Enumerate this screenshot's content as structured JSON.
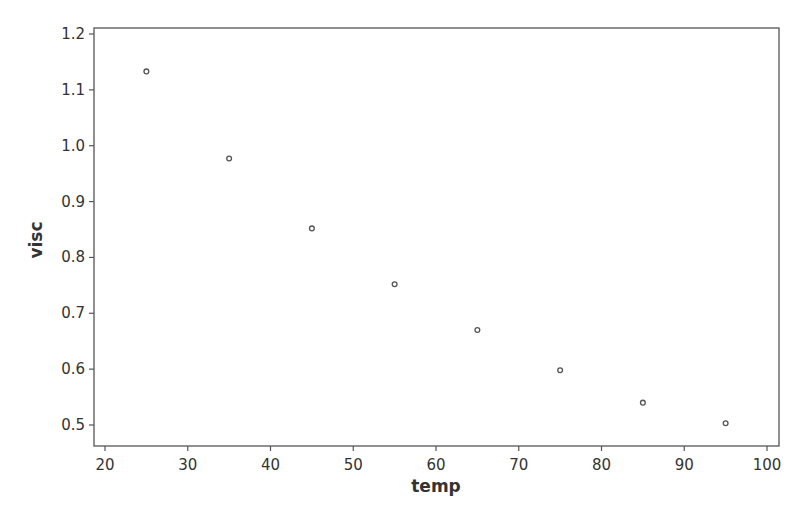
{
  "chart_data": {
    "type": "scatter",
    "title": "",
    "xlabel": "temp",
    "ylabel": "visc",
    "xlim": [
      18.6,
      101.5
    ],
    "ylim": [
      0.463,
      1.211
    ],
    "x_ticks": [
      20,
      30,
      40,
      50,
      60,
      70,
      80,
      90,
      100
    ],
    "y_ticks": [
      0.5,
      0.6,
      0.7,
      0.8,
      0.9,
      1.0,
      1.1,
      1.2
    ],
    "x_tick_labels": [
      "20",
      "30",
      "40",
      "50",
      "60",
      "70",
      "80",
      "90",
      "100"
    ],
    "y_tick_labels": [
      "0.5",
      "0.6",
      "0.7",
      "0.8",
      "0.9",
      "1.0",
      "1.1",
      "1.2"
    ],
    "grid": false,
    "legend": null,
    "series": [
      {
        "name": "visc",
        "x": [
          25,
          35,
          45,
          55,
          65,
          75,
          85,
          95
        ],
        "y": [
          1.133,
          0.977,
          0.852,
          0.752,
          0.67,
          0.598,
          0.54,
          0.503
        ]
      }
    ]
  },
  "colors": {
    "axis": "#555555",
    "marker": "#555555",
    "text": "#333333",
    "background": "#ffffff"
  }
}
